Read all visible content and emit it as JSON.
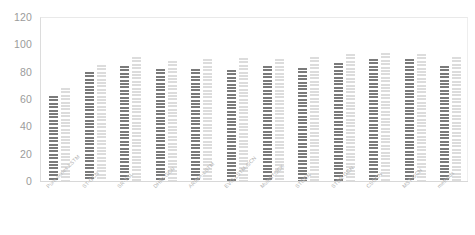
{
  "chart_data": {
    "type": "bar",
    "title": "",
    "subtitle": "",
    "xlabel": "",
    "ylabel": "",
    "ylim": [
      0,
      120
    ],
    "yticks": [
      0,
      20,
      40,
      60,
      80,
      100,
      120
    ],
    "ytick_labels": [
      "0",
      "20",
      "40",
      "60",
      "80",
      "100",
      "120"
    ],
    "grid": false,
    "legend": "none",
    "categories": [
      "Pure series LSTM",
      "ST-GCN",
      "SR-TSL",
      "DHRI-GCN",
      "ARIMA-LSTM",
      "EVO-LSTM-GCN",
      "MultiSTOCK",
      "STGCN",
      "STSR-GCN",
      "CSGCN",
      "MST-GCN",
      "methods"
    ],
    "series": [
      {
        "name": "series-1",
        "color": "#6f6f6f",
        "values": [
          62,
          80,
          84,
          82,
          82,
          81,
          84,
          83,
          86,
          89,
          89,
          84
        ]
      },
      {
        "name": "series-2",
        "color": "#dcdcdc",
        "values": [
          68,
          85,
          91,
          88,
          89,
          90,
          89,
          91,
          93,
          94,
          93,
          91
        ]
      }
    ]
  },
  "axis": {
    "y_axis_color": "#9b9b9b",
    "x_label_color": "#b4b4b4"
  }
}
